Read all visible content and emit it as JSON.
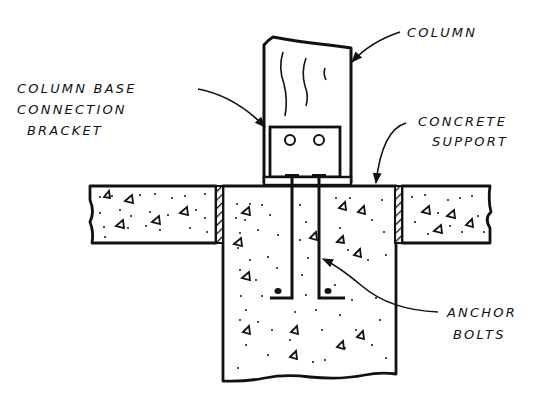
{
  "diagram": {
    "type": "technical-section-drawing",
    "colors": {
      "ink": "#111111",
      "paper": "#ffffff"
    }
  },
  "labels": {
    "column": {
      "lines": [
        "COLUMN"
      ]
    },
    "bracket": {
      "lines": [
        "COLUMN BASE",
        "CONNECTION",
        "BRACKET"
      ]
    },
    "support": {
      "lines": [
        "CONCRETE",
        "SUPPORT"
      ]
    },
    "anchor": {
      "lines": [
        "ANCHOR",
        "BOLTS"
      ]
    }
  },
  "components": [
    {
      "id": "column",
      "name": "Column"
    },
    {
      "id": "bracket",
      "name": "Column base connection bracket",
      "bolt_holes": 2
    },
    {
      "id": "slab-left",
      "name": "Concrete slab (left)"
    },
    {
      "id": "slab-right",
      "name": "Concrete slab (right)"
    },
    {
      "id": "footing",
      "name": "Concrete support / footing"
    },
    {
      "id": "joints",
      "name": "Expansion joints",
      "count": 2
    },
    {
      "id": "anchor-bolts",
      "name": "Anchor bolts",
      "count": 2
    }
  ]
}
